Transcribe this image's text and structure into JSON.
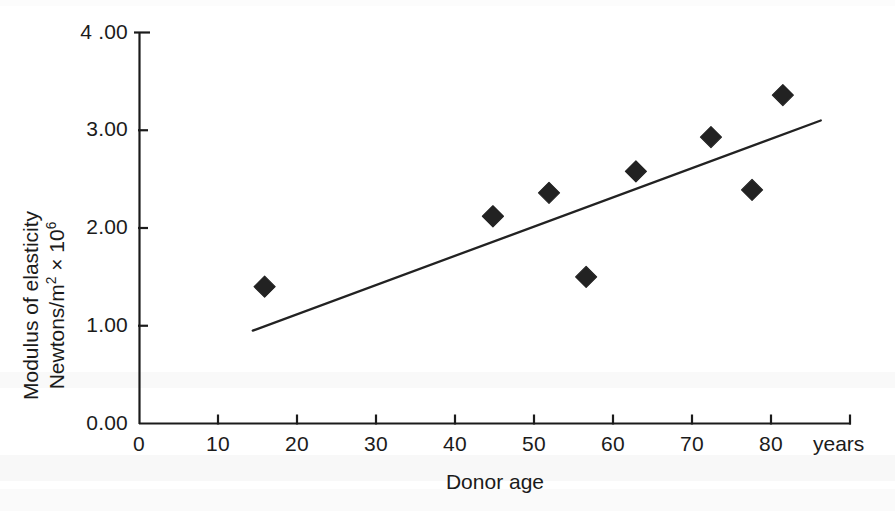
{
  "chart_data": {
    "type": "scatter",
    "title": "",
    "subtitle": "",
    "xlabel": "Donor age",
    "ylabel": "Modulus of elasticity Newtons/m2 × 106",
    "ylabel_line1": "Modulus of elasticity",
    "ylabel_line2_prefix": "Newtons/m",
    "ylabel_line2_sup1": "2",
    "ylabel_line2_mid": " × 10",
    "ylabel_line2_sup2": "6",
    "x_unit": "years",
    "xlim": [
      0,
      90
    ],
    "ylim": [
      0.0,
      4.0
    ],
    "xticks": [
      0,
      10,
      20,
      30,
      40,
      50,
      60,
      70,
      80
    ],
    "xticklabels": [
      "0",
      "10",
      "20",
      "30",
      "40",
      "50",
      "60",
      "70",
      "80"
    ],
    "yticks": [
      0.0,
      1.0,
      2.0,
      3.0,
      4.0
    ],
    "yticklabels": [
      "0.00",
      "1.00",
      "2.00",
      "3.00",
      "4 .00"
    ],
    "grid": false,
    "legend": false,
    "marker": "diamond",
    "marker_color": "#222222",
    "line_color": "#222222",
    "points": [
      {
        "x": 15.9,
        "y": 1.4
      },
      {
        "x": 44.8,
        "y": 2.12
      },
      {
        "x": 51.9,
        "y": 2.36
      },
      {
        "x": 56.6,
        "y": 1.5
      },
      {
        "x": 62.9,
        "y": 2.58
      },
      {
        "x": 72.4,
        "y": 2.93
      },
      {
        "x": 77.6,
        "y": 2.39
      },
      {
        "x": 81.5,
        "y": 3.36
      }
    ],
    "trendline": {
      "name": "linear fit",
      "x0": 14.4,
      "y0": 0.95,
      "x1": 86.3,
      "y1": 3.1
    }
  }
}
